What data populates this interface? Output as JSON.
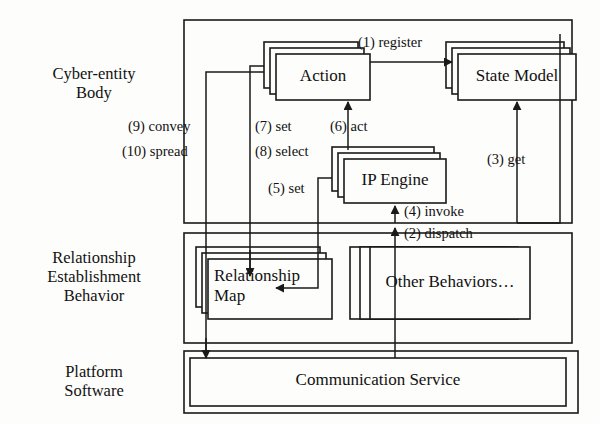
{
  "diagram": {
    "stroke_color": "#1a1a1a",
    "background_color": "#fdfdfb",
    "layers": [
      {
        "id": "cyber-entity-body",
        "label": "Cyber-entity\nBody"
      },
      {
        "id": "relationship-establishment-behavior",
        "label": "Relationship\nEstablishment\nBehavior"
      },
      {
        "id": "platform-software",
        "label": "Platform\nSoftware"
      }
    ],
    "nodes": [
      {
        "id": "action",
        "label": "Action",
        "stacked": true
      },
      {
        "id": "state-model",
        "label": "State Model",
        "stacked": true
      },
      {
        "id": "ip-engine",
        "label": "IP Engine",
        "stacked": true
      },
      {
        "id": "relationship-map",
        "label": "Relationship\nMap",
        "stacked": true
      },
      {
        "id": "other-behaviors",
        "label": "Other Behaviors…",
        "stacked": true
      },
      {
        "id": "communication-service",
        "label": "Communication Service",
        "stacked": false
      }
    ],
    "edges": [
      {
        "id": "edge-1",
        "label": "(1) register",
        "from": "action",
        "to": "state-model"
      },
      {
        "id": "edge-2",
        "label": "(2) dispatch",
        "from": "communication-service",
        "to": "ip-engine"
      },
      {
        "id": "edge-3",
        "label": "(3) get",
        "from": "state-model",
        "to": "ip-engine"
      },
      {
        "id": "edge-4",
        "label": "(4) invoke",
        "from": "other-behaviors",
        "to": "ip-engine"
      },
      {
        "id": "edge-5",
        "label": "(5) set",
        "from": "ip-engine",
        "to": "relationship-map"
      },
      {
        "id": "edge-6",
        "label": "(6) act",
        "from": "ip-engine",
        "to": "action"
      },
      {
        "id": "edge-7",
        "label": "(7) set",
        "from": "action",
        "to": "relationship-map"
      },
      {
        "id": "edge-8",
        "label": "(8) select",
        "from": "action",
        "to": "relationship-map"
      },
      {
        "id": "edge-9",
        "label": "(9) convey",
        "from": "action",
        "to": "communication-service"
      },
      {
        "id": "edge-10",
        "label": "(10) spread",
        "from": "action",
        "to": "communication-service"
      }
    ]
  }
}
